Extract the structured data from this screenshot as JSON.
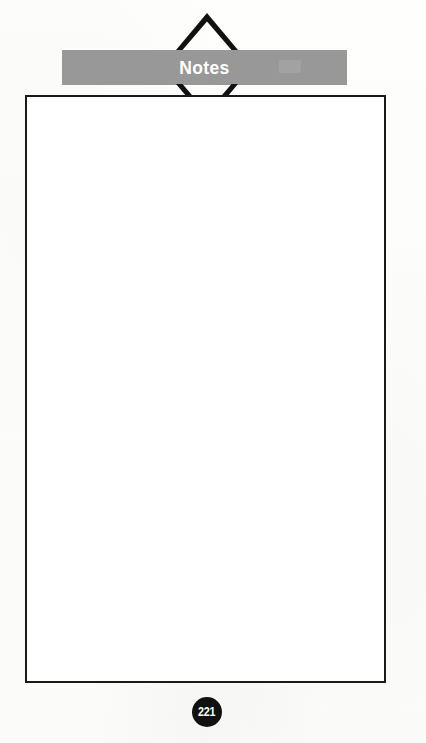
{
  "page": {
    "background_color": "#fdfdfc",
    "width": 426,
    "height": 743
  },
  "header": {
    "title": "Notes",
    "band_color": "#989898",
    "title_color": "#ffffff",
    "chevron_up_icon": "chevron-up-icon",
    "chevron_down_icon": "chevron-down-icon",
    "chevron_color": "#111111"
  },
  "notes_area": {
    "border_color": "#1a1a1a",
    "fill_color": "#ffffff",
    "content": ""
  },
  "footer": {
    "page_number": "221",
    "badge_color": "#111111",
    "badge_text_color": "#ffffff"
  }
}
